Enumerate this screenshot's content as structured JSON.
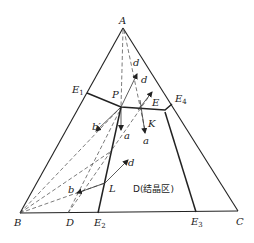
{
  "diagram": {
    "type": "ternary-phase-diagram",
    "vertices": {
      "A": {
        "label": "A"
      },
      "B": {
        "label": "B"
      },
      "C": {
        "label": "C"
      }
    },
    "eutectic_points": {
      "E1": {
        "label": "E",
        "sub": "1"
      },
      "E2": {
        "label": "E",
        "sub": "2"
      },
      "E3": {
        "label": "E",
        "sub": "3"
      },
      "E4": {
        "label": "E",
        "sub": "4"
      }
    },
    "points": {
      "P": "P",
      "E": "E",
      "K": "K",
      "L": "L",
      "D": "D"
    },
    "arrow_labels": {
      "d_top1": "d",
      "d_top2": "d",
      "a_left": "a",
      "a_right": "a",
      "b_prime": "b′",
      "b": "b",
      "d_lower": "d"
    },
    "region_label": "D(结晶区)"
  }
}
